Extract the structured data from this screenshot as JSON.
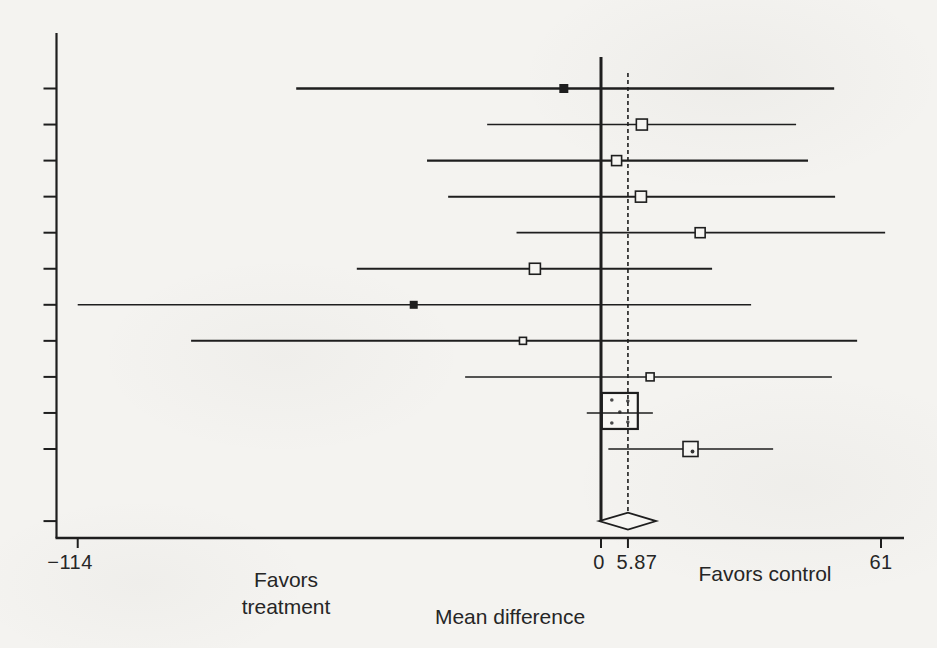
{
  "figure": {
    "kind": "forest-plot-scan",
    "background_color": "#f4f3f0",
    "ink_color": "#1e1e1e"
  },
  "chart_data": {
    "type": "scatter",
    "subtype": "forest-plot",
    "title": "",
    "xlabel": "Mean difference",
    "ylabel": "",
    "x_axis": {
      "range": [
        -121,
        66
      ],
      "ticks": [
        {
          "value": -114,
          "label": "−114"
        },
        {
          "value": 0,
          "label": "0"
        },
        {
          "value": 5.87,
          "label": "5.87"
        },
        {
          "value": 61,
          "label": "61"
        }
      ]
    },
    "annotations": {
      "favors_treatment": "Favors treatment",
      "favors_control": "Favors control"
    },
    "reference_lines": [
      {
        "value": 0,
        "style": "solid"
      },
      {
        "value": 5.87,
        "style": "dashed"
      }
    ],
    "grid": false,
    "legend": "none",
    "studies": [
      {
        "est": -8.1,
        "lo": -66.4,
        "hi": 50.8,
        "marker": "filled",
        "size": 9,
        "lw": 2.4
      },
      {
        "est": 8.9,
        "lo": -24.8,
        "hi": 42.5,
        "marker": "open",
        "size": 11,
        "lw": 1.5
      },
      {
        "est": 3.4,
        "lo": -37.9,
        "hi": 45.1,
        "marker": "open",
        "size": 10,
        "lw": 2.2
      },
      {
        "est": 8.7,
        "lo": -33.3,
        "hi": 51.0,
        "marker": "open",
        "size": 11,
        "lw": 2.0
      },
      {
        "est": 21.6,
        "lo": -18.4,
        "hi": 61.9,
        "marker": "open",
        "size": 10,
        "lw": 1.8
      },
      {
        "est": -14.4,
        "lo": -53.2,
        "hi": 24.2,
        "marker": "open",
        "size": 11,
        "lw": 2.0
      },
      {
        "est": -40.8,
        "lo": -114.0,
        "hi": 32.7,
        "marker": "filled",
        "size": 8,
        "lw": 1.5
      },
      {
        "est": -17.0,
        "lo": -89.3,
        "hi": 55.8,
        "marker": "open",
        "size": 7,
        "lw": 2.0
      },
      {
        "est": 10.7,
        "lo": -29.6,
        "hi": 50.3,
        "marker": "open",
        "size": 8,
        "lw": 1.5
      },
      {
        "est": 4.1,
        "lo": -3.1,
        "hi": 11.3,
        "marker": "open-dotted",
        "size": 36,
        "lw": 1.4
      },
      {
        "est": 19.5,
        "lo": 1.6,
        "hi": 37.5,
        "marker": "open-dot",
        "size": 15,
        "lw": 1.3
      }
    ],
    "pooled": {
      "est": 5.87,
      "lo": -0.4,
      "hi": 12.0,
      "marker": "diamond"
    }
  }
}
